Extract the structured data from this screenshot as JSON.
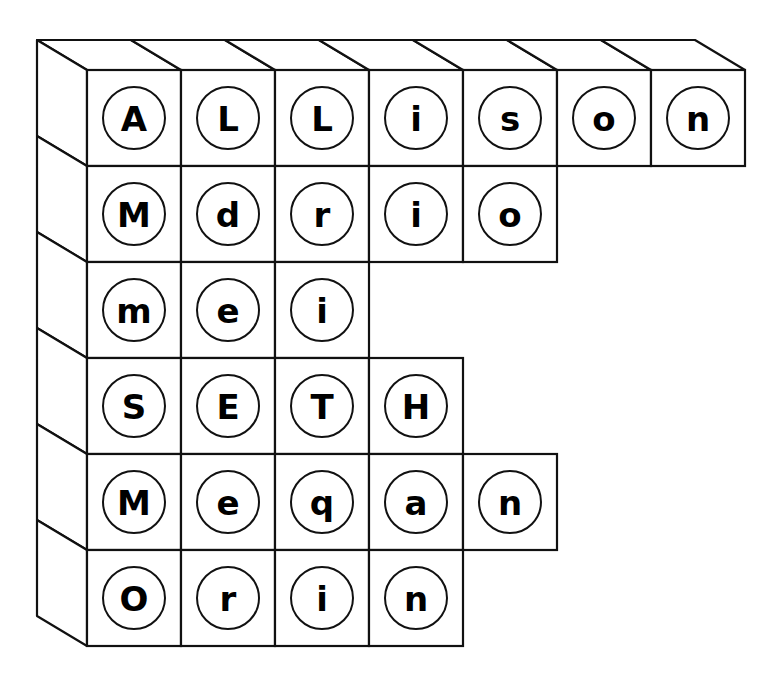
{
  "diagram": {
    "rows": [
      {
        "word": "Allison",
        "letters": [
          "A",
          "L",
          "L",
          "i",
          "s",
          "o",
          "n"
        ]
      },
      {
        "word": "Mdrio",
        "letters": [
          "M",
          "d",
          "r",
          "i",
          "o"
        ]
      },
      {
        "word": "mei",
        "letters": [
          "m",
          "e",
          "i"
        ]
      },
      {
        "word": "SETH",
        "letters": [
          "S",
          "E",
          "T",
          "H"
        ]
      },
      {
        "word": "Meqan",
        "letters": [
          "M",
          "e",
          "q",
          "a",
          "n"
        ]
      },
      {
        "word": "Orin",
        "letters": [
          "O",
          "r",
          "i",
          "n"
        ]
      }
    ],
    "colors": {
      "stroke": "#111111",
      "face": "#ffffff",
      "ink": "#000000"
    }
  }
}
